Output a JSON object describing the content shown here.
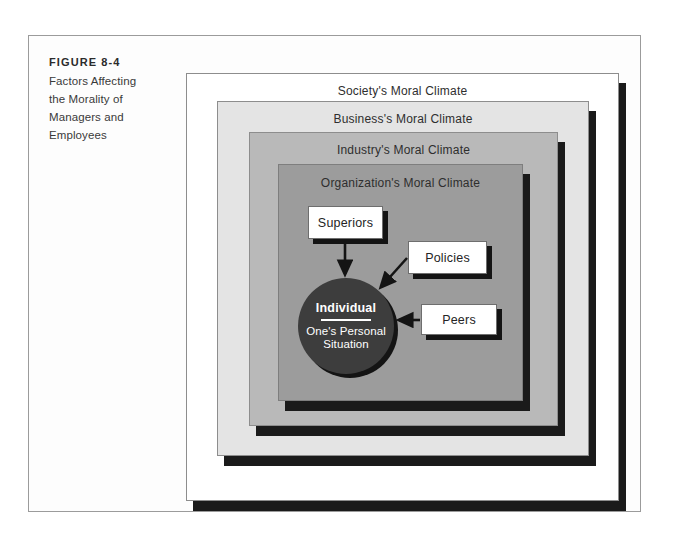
{
  "figure": {
    "number_label": "FIGURE 8-4",
    "caption_lines": [
      "Factors Affecting",
      "the Morality of",
      "Managers and",
      "Employees"
    ]
  },
  "diagram": {
    "type": "nested-concentric-layers",
    "layers": [
      {
        "id": "society",
        "label": "Society's Moral Climate",
        "fill": "#ffffff",
        "level": 1
      },
      {
        "id": "business",
        "label": "Business's Moral Climate",
        "fill": "#e4e4e4",
        "level": 2
      },
      {
        "id": "industry",
        "label": "Industry's Moral Climate",
        "fill": "#b9b9b9",
        "level": 3
      },
      {
        "id": "organization",
        "label": "Organization's Moral Climate",
        "fill": "#9c9c9c",
        "level": 4
      }
    ],
    "center": {
      "title": "Individual",
      "subtitle": "One's Personal Situation",
      "fill": "#3d3d3d",
      "text_color": "#ffffff"
    },
    "factors": [
      {
        "id": "superiors",
        "label": "Superiors",
        "arrow_to": "individual",
        "arrow_direction": "down"
      },
      {
        "id": "policies",
        "label": "Policies",
        "arrow_to": "individual",
        "arrow_direction": "down-left"
      },
      {
        "id": "peers",
        "label": "Peers",
        "arrow_to": "individual",
        "arrow_direction": "left"
      }
    ],
    "colors": {
      "shadow": "#141414",
      "frame_border": "#9b9b9b",
      "label_text": "#2e2e2e",
      "page_background": "#ffffff"
    }
  }
}
